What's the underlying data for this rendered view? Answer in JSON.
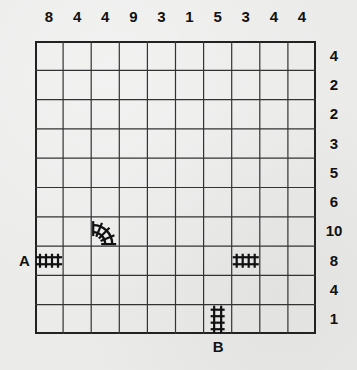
{
  "puzzle": {
    "type": "train-tracks",
    "rows": 10,
    "cols": 10,
    "column_clues": [
      "8",
      "4",
      "4",
      "9",
      "3",
      "1",
      "5",
      "3",
      "4",
      "4"
    ],
    "row_clues": [
      "4",
      "2",
      "2",
      "3",
      "5",
      "6",
      "10",
      "8",
      "4",
      "1"
    ],
    "entrance_label": "A",
    "exit_label": "B",
    "given_pieces": [
      {
        "row": 7,
        "col": 0,
        "piece": "horizontal-straight"
      },
      {
        "row": 6,
        "col": 2,
        "piece": "curve-top-right"
      },
      {
        "row": 7,
        "col": 7,
        "piece": "horizontal-straight"
      },
      {
        "row": 9,
        "col": 6,
        "piece": "vertical-straight"
      }
    ],
    "entrance": {
      "row": 7,
      "side": "left"
    },
    "exit": {
      "col": 6,
      "side": "bottom"
    }
  }
}
